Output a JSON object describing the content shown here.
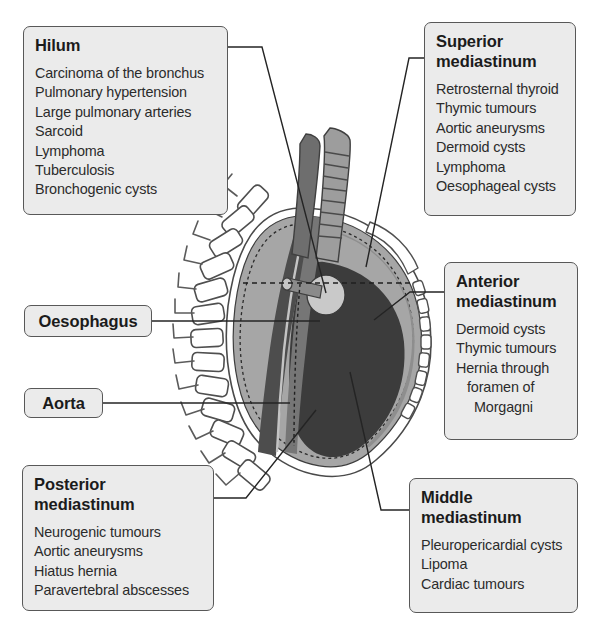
{
  "diagram": {
    "callouts": [
      {
        "id": "hilum",
        "title": "Hilum",
        "items": [
          "Carcinoma of the bronchus",
          "Pulmonary hypertension",
          "Large pulmonary arteries",
          "Sarcoid",
          "Lymphoma",
          "Tuberculosis",
          "Bronchogenic cysts"
        ]
      },
      {
        "id": "superior",
        "title": "Superior\nmediastinum",
        "items": [
          "Retrosternal thyroid",
          "Thymic tumours",
          "Aortic aneurysms",
          "Dermoid cysts",
          "Lymphoma",
          "Oesophageal cysts"
        ]
      },
      {
        "id": "anterior",
        "title": "Anterior\nmediastinum",
        "items": [
          "Dermoid cysts",
          "Thymic tumours",
          "Hernia through",
          "foramen of",
          "Morgagni"
        ]
      },
      {
        "id": "middle",
        "title": "Middle\nmediastinum",
        "items": [
          "Pleuropericardial cysts",
          "Lipoma",
          "Cardiac tumours"
        ]
      },
      {
        "id": "posterior",
        "title": "Posterior\nmediastinum",
        "items": [
          "Neurogenic tumours",
          "Aortic aneurysms",
          "Hiatus hernia",
          "Paravertebral abscesses"
        ]
      }
    ],
    "tags": [
      {
        "id": "oesophagus",
        "label": "Oesophagus"
      },
      {
        "id": "aorta",
        "label": "Aorta"
      }
    ],
    "colors": {
      "box_fill": "#ebebeb",
      "box_border": "#585858",
      "title_text": "#1b1b1b",
      "item_text": "#2b2b2b",
      "leader_line": "#2a2a2a",
      "lung_light": "#a8a8a8",
      "lung_mid": "#8e8e8e",
      "heart_dark": "#3c3c3c",
      "aorta_dark": "#4a4a4a",
      "oesophagus_grey": "#6e6e6e",
      "trachea_grey": "#9a9a9a",
      "hilum_light": "#c8c8c8",
      "bone_outline": "#555555"
    }
  }
}
